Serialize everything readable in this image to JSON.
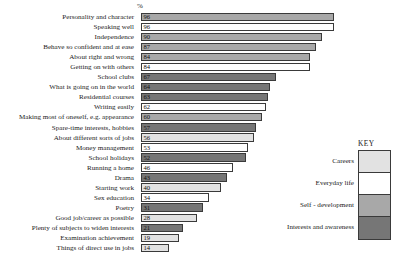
{
  "header": {
    "percent_symbol": "%"
  },
  "legend": {
    "title": "KEY",
    "items": [
      {
        "label": "Careers",
        "color": "#e2e2e2"
      },
      {
        "label": "Everyday life",
        "color": "#ffffff"
      },
      {
        "label": "Self - development",
        "color": "#a8a8a8"
      },
      {
        "label": "Interests and awareness",
        "color": "#767676"
      }
    ]
  },
  "chart_data": {
    "type": "bar",
    "orientation": "horizontal",
    "title": "",
    "xlabel": "%",
    "ylabel": "",
    "xlim": [
      0,
      100
    ],
    "grid": false,
    "legend_position": "right-bottom",
    "categories": [
      "Personality and character",
      "Speaking well",
      "Independence",
      "Behave so confident and at ease",
      "About right and wrong",
      "Getting on with others",
      "School clubs",
      "What is going on in the world",
      "Residential courses",
      "Writing easily",
      "Making most of oneself, e.g. appearance",
      "Spare-time interests, hobbies",
      "About different sorts of jobs",
      "Money management",
      "School holidays",
      "Running a home",
      "Drama",
      "Starting work",
      "Sex education",
      "Poetry",
      "Good job/career as possible",
      "Plenty of subjects to widen interests",
      "Examination achievement",
      "Things of direct use in jobs"
    ],
    "values": [
      96,
      96,
      90,
      87,
      84,
      84,
      67,
      64,
      63,
      62,
      60,
      57,
      56,
      53,
      52,
      46,
      43,
      40,
      34,
      31,
      28,
      21,
      19,
      14
    ],
    "groups": [
      "Self - development",
      "Everyday life",
      "Self - development",
      "Self - development",
      "Self - development",
      "Everyday life",
      "Interests and awareness",
      "Interests and awareness",
      "Interests and awareness",
      "Everyday life",
      "Self - development",
      "Interests and awareness",
      "Careers",
      "Everyday life",
      "Interests and awareness",
      "Everyday life",
      "Interests and awareness",
      "Careers",
      "Everyday life",
      "Interests and awareness",
      "Careers",
      "Interests and awareness",
      "Careers",
      "Careers"
    ],
    "group_colors": {
      "Careers": "#e2e2e2",
      "Everyday life": "#ffffff",
      "Self - development": "#a8a8a8",
      "Interests and awareness": "#767676"
    }
  }
}
